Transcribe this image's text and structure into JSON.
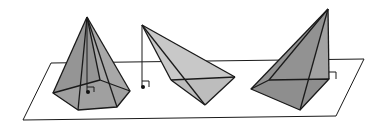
{
  "figure": {
    "colors": {
      "plane_stroke": "#1a1a1a",
      "face_dark": "#8c8c8c",
      "face_mid": "#a6a6a6",
      "face_light": "#c2c2c2",
      "background": "#ffffff"
    },
    "objects": [
      {
        "name": "pentagonal-pyramid",
        "altitude_inside": true
      },
      {
        "name": "triangular-pyramid",
        "altitude_outside": true
      },
      {
        "name": "quadrilateral-pyramid",
        "altitude_on_edge": true
      }
    ]
  }
}
